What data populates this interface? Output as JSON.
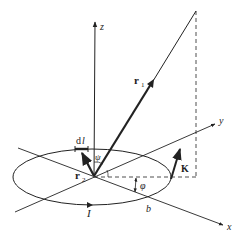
{
  "diagram": {
    "labels": {
      "z_axis": "z",
      "y_axis": "y",
      "x_axis": "x",
      "r1": "r",
      "r1_sub": "1",
      "r2": "r",
      "r2_sub": "2",
      "dl_d": "d",
      "dl_l": "l",
      "psi": "ψ",
      "phi": "φ",
      "K": "K",
      "b": "b",
      "I": "I"
    },
    "colors": {
      "stroke": "#222222",
      "background": "#ffffff"
    }
  }
}
